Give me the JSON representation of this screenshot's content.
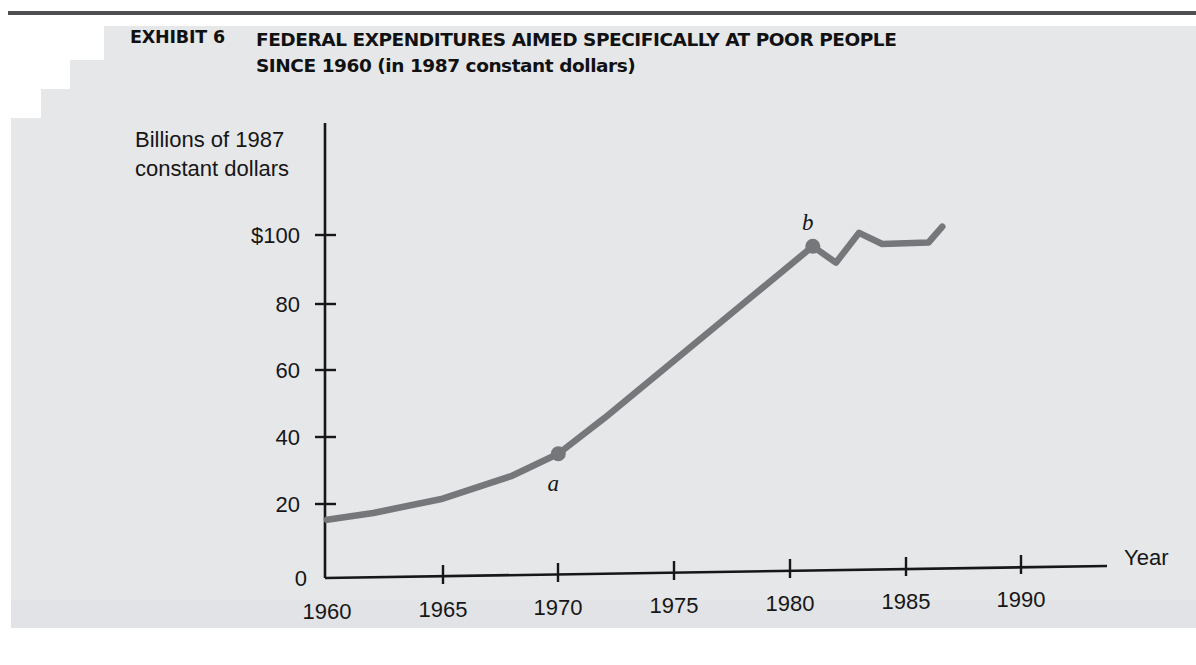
{
  "exhibit": {
    "label": "EXHIBIT 6",
    "title_line1": "FEDERAL EXPENDITURES AIMED SPECIFICALLY AT POOR PEOPLE",
    "title_line2": "SINCE 1960 (in 1987 constant dollars)"
  },
  "chart_data": {
    "type": "line",
    "xlabel": "Year",
    "ylabel": "Billions of 1987 constant dollars",
    "ylabel_line1": "Billions of 1987",
    "ylabel_line2": "constant dollars",
    "xlim": [
      1960,
      1992
    ],
    "ylim": [
      0,
      100
    ],
    "grid": false,
    "legend": "none",
    "line_color": "#76777a",
    "axis_color": "#17171a",
    "x_ticks": [
      1960,
      1965,
      1970,
      1975,
      1980,
      1985,
      1990
    ],
    "x_tick_labels": [
      "1960",
      "1965",
      "1970",
      "1975",
      "1980",
      "1985",
      "1990"
    ],
    "y_ticks": [
      0,
      20,
      40,
      60,
      80,
      100
    ],
    "y_tick_labels": [
      "0",
      "20",
      "40",
      "60",
      "80",
      "$100"
    ],
    "x": [
      1960,
      1962,
      1965,
      1968,
      1970,
      1972,
      1975,
      1978,
      1981,
      1982,
      1983,
      1984,
      1986,
      1986.6
    ],
    "y": [
      17,
      18.5,
      22,
      28,
      34,
      44,
      60,
      76,
      92,
      87,
      95.5,
      92,
      92,
      96.5
    ],
    "series": [
      {
        "name": "Federal expenditures aimed at poor people",
        "values": [
          17,
          18.5,
          22,
          28,
          34,
          44,
          60,
          76,
          92,
          87,
          95.5,
          92,
          92,
          96.5
        ]
      }
    ],
    "markers": [
      {
        "id": "a",
        "label": "a",
        "x": 1970,
        "y": 34,
        "label_position": "below-right"
      },
      {
        "id": "b",
        "label": "b",
        "x": 1981,
        "y": 92,
        "label_position": "above"
      }
    ]
  }
}
